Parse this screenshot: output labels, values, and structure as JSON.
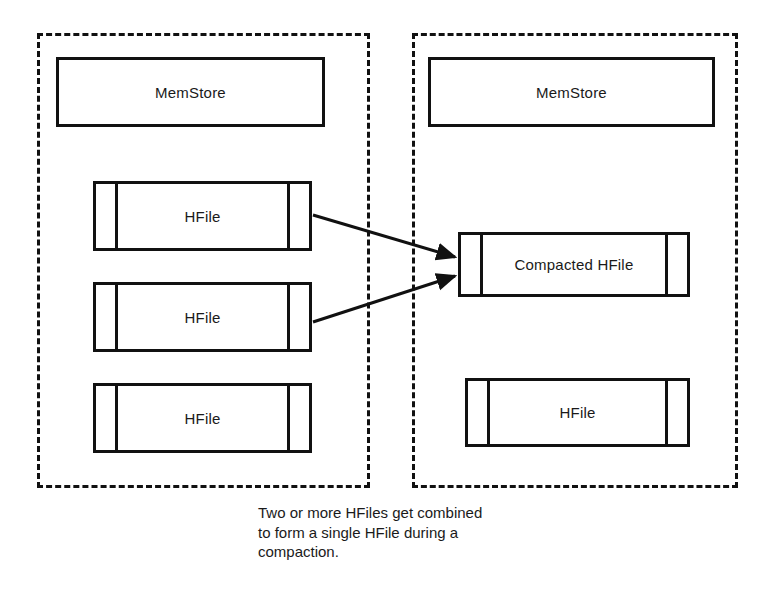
{
  "diagram": {
    "stroke_color": "#111111",
    "text_color": "#1a1a1a",
    "background": "#ffffff",
    "regions": [
      {
        "name": "before-compaction",
        "x": 37,
        "y": 33,
        "w": 333,
        "h": 455
      },
      {
        "name": "after-compaction",
        "x": 412,
        "y": 33,
        "w": 326,
        "h": 455
      }
    ],
    "left_panel": {
      "memstore": {
        "label": "MemStore",
        "x": 56,
        "y": 57,
        "w": 269,
        "h": 70
      },
      "hfiles": [
        {
          "label": "HFile",
          "x": 93,
          "y": 181,
          "w": 219,
          "h": 70
        },
        {
          "label": "HFile",
          "x": 93,
          "y": 282,
          "w": 219,
          "h": 70
        },
        {
          "label": "HFile",
          "x": 93,
          "y": 383,
          "w": 219,
          "h": 70
        }
      ]
    },
    "right_panel": {
      "memstore": {
        "label": "MemStore",
        "x": 428,
        "y": 57,
        "w": 287,
        "h": 70
      },
      "hfiles": [
        {
          "label": "Compacted HFile",
          "x": 458,
          "y": 232,
          "w": 232,
          "h": 65
        },
        {
          "label": "HFile",
          "x": 465,
          "y": 378,
          "w": 225,
          "h": 69
        }
      ]
    },
    "arrows": [
      {
        "name": "arrow-hfile1-to-compacted",
        "x1": 313,
        "y1": 215,
        "x2": 455,
        "y2": 257
      },
      {
        "name": "arrow-hfile2-to-compacted",
        "x1": 313,
        "y1": 322,
        "x2": 455,
        "y2": 276
      }
    ],
    "caption": {
      "text": "Two or more HFiles get combined\nto form a single HFile during a\ncompaction.",
      "x": 258,
      "y": 503
    }
  }
}
